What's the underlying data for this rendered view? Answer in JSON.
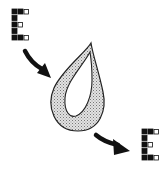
{
  "diagram": {
    "colors": {
      "ink": "#111111",
      "fill_stipple": "#c9c9c9",
      "background": "#ffffff"
    },
    "input_grid": {
      "label": "input-pattern",
      "rows": [
        [
          "filled",
          "filled",
          "hollow"
        ],
        [
          "filled"
        ],
        [
          "filled",
          "hollow"
        ],
        [
          "filled"
        ],
        [
          "filled",
          "filled",
          "hollow"
        ]
      ]
    },
    "output_grid": {
      "label": "output-pattern",
      "rows": [
        [
          "filled",
          "filled",
          "hollow"
        ],
        [
          "filled"
        ],
        [
          "filled",
          "hollow"
        ],
        [
          "filled"
        ],
        [
          "filled",
          "filled",
          "hollow"
        ]
      ]
    },
    "arrows": [
      {
        "name": "input-arrow",
        "direction": "down-right"
      },
      {
        "name": "output-arrow",
        "direction": "down-right"
      }
    ],
    "container": {
      "shape": "teardrop",
      "style": "hollow with stippled rim"
    }
  }
}
